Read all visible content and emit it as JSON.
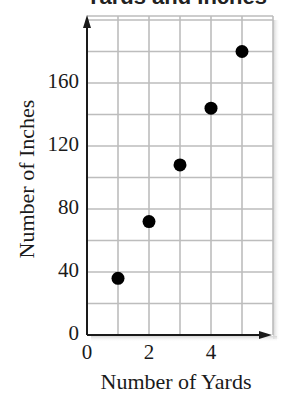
{
  "chart_data": {
    "type": "scatter",
    "title": "Yards and Inches",
    "xlabel": "Number of Yards",
    "ylabel": "Number of Inches",
    "x": [
      1,
      2,
      3,
      4,
      5
    ],
    "values": [
      36,
      72,
      108,
      144,
      180
    ],
    "series": [
      {
        "name": "Inches per Yards",
        "x": [
          1,
          2,
          3,
          4,
          5
        ],
        "values": [
          36,
          72,
          108,
          144,
          180
        ]
      }
    ],
    "xlim": [
      0,
      6
    ],
    "ylim": [
      0,
      200
    ],
    "x_ticks": [
      "0",
      "2",
      "4"
    ],
    "y_ticks": [
      "0",
      "40",
      "80",
      "120",
      "160"
    ],
    "x_tick_values": [
      0,
      2,
      4
    ],
    "y_tick_values": [
      0,
      40,
      80,
      120,
      160
    ],
    "grid": true,
    "x_grid_step": 1,
    "y_grid_step": 20,
    "legend": "none",
    "marker_color": "#000000",
    "grid_color": "#bdbdbd",
    "axis_color": "#1a1a1a"
  }
}
